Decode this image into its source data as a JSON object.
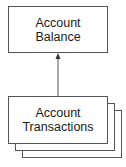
{
  "diagram": {
    "nodes": [
      {
        "id": "balance",
        "lines": [
          "Account",
          "Balance"
        ],
        "stacked": false
      },
      {
        "id": "transactions",
        "lines": [
          "Account",
          "Transactions"
        ],
        "stacked": true,
        "stack_count": 3
      }
    ],
    "edges": [
      {
        "from": "transactions",
        "to": "balance",
        "arrow": "to"
      }
    ],
    "colors": {
      "stroke": "#555555",
      "text": "#1a1a1a",
      "background": "#ffffff"
    }
  }
}
